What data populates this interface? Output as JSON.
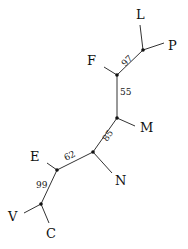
{
  "diagram": {
    "type": "unrooted phylogenetic tree",
    "leaves": [
      {
        "id": "L",
        "label": "L"
      },
      {
        "id": "P",
        "label": "P"
      },
      {
        "id": "F",
        "label": "F"
      },
      {
        "id": "M",
        "label": "M"
      },
      {
        "id": "N",
        "label": "N"
      },
      {
        "id": "E",
        "label": "E"
      },
      {
        "id": "V",
        "label": "V"
      },
      {
        "id": "C",
        "label": "C"
      }
    ],
    "support_values": [
      {
        "edge": "LP-F",
        "value": "97"
      },
      {
        "edge": "F-M",
        "value": "55"
      },
      {
        "edge": "M-N",
        "value": "85"
      },
      {
        "edge": "N-E",
        "value": "62"
      },
      {
        "edge": "E-VC",
        "value": "99"
      }
    ]
  }
}
